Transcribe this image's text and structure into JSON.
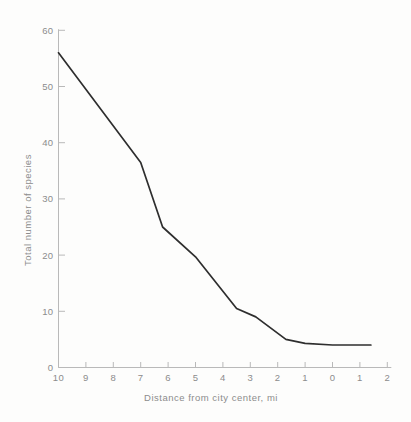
{
  "figure": {
    "background": "#fdfdfc"
  },
  "chart_data": {
    "type": "line",
    "title": "",
    "xlabel": "Distance from city center, mi",
    "ylabel": "Total number of species",
    "x_tick_labels": [
      "10",
      "9",
      "8",
      "7",
      "6",
      "5",
      "4",
      "3",
      "2",
      "1",
      "0",
      "1",
      "2"
    ],
    "x_tick_positions": [
      10,
      9,
      8,
      7,
      6,
      5,
      4,
      3,
      2,
      1,
      0,
      -1,
      -2
    ],
    "y_ticks": [
      0,
      10,
      20,
      30,
      40,
      50,
      60
    ],
    "x_range": [
      10,
      -2
    ],
    "ylim": [
      0,
      60
    ],
    "x_axis_reversed": true,
    "grid": false,
    "legend": false,
    "series": [
      {
        "name": "total-species",
        "points": [
          [
            10,
            56
          ],
          [
            7,
            36.5
          ],
          [
            6.2,
            25
          ],
          [
            5,
            19.7
          ],
          [
            3.5,
            10.5
          ],
          [
            2.8,
            9
          ],
          [
            1.7,
            5
          ],
          [
            1,
            4.3
          ],
          [
            0,
            4
          ],
          [
            -1.4,
            4
          ]
        ]
      }
    ],
    "line_color": "#2e2e2e",
    "axis_color": "#b9b9b9",
    "label_color": "#8c8c8c"
  }
}
